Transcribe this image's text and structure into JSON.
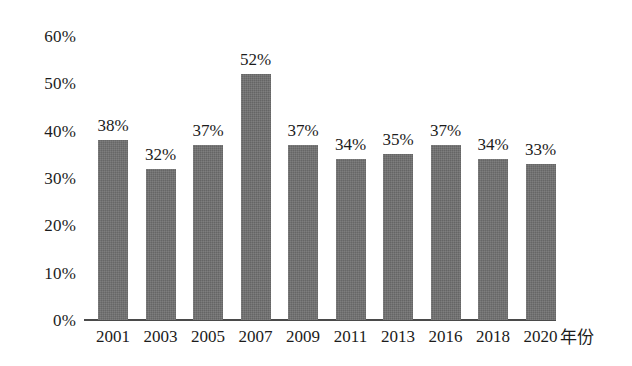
{
  "chart_data": {
    "type": "bar",
    "title": "",
    "xlabel": "年份",
    "ylabel": "",
    "categories": [
      "2001",
      "2003",
      "2005",
      "2007",
      "2009",
      "2011",
      "2013",
      "2016",
      "2018",
      "2020"
    ],
    "values": [
      38,
      32,
      37,
      52,
      37,
      34,
      35,
      37,
      34,
      33
    ],
    "value_labels": [
      "38%",
      "32%",
      "37%",
      "52%",
      "37%",
      "34%",
      "35%",
      "37%",
      "34%",
      "33%"
    ],
    "ylim": [
      0,
      60
    ],
    "ytick_values": [
      0,
      10,
      20,
      30,
      40,
      50,
      60
    ],
    "ytick_labels": [
      "0%",
      "10%",
      "20%",
      "30%",
      "40%",
      "50%",
      "60%"
    ],
    "grid": false,
    "legend": "none",
    "bar_color": "#707070",
    "axis_color": "#4a4a4a",
    "text_color": "#1c1c1c",
    "background": "#ffffff"
  }
}
